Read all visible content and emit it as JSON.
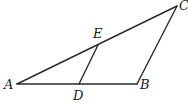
{
  "diagram": {
    "type": "geometry-triangle",
    "points": {
      "A": {
        "label": "A",
        "x": 17,
        "y": 84
      },
      "B": {
        "label": "B",
        "x": 137,
        "y": 84
      },
      "C": {
        "label": "C",
        "x": 177,
        "y": 6
      },
      "D": {
        "label": "D",
        "x": 79,
        "y": 84
      },
      "E": {
        "label": "E",
        "x": 98,
        "y": 45
      }
    },
    "segments": [
      {
        "from": "A",
        "to": "B"
      },
      {
        "from": "B",
        "to": "C"
      },
      {
        "from": "A",
        "to": "C"
      },
      {
        "from": "D",
        "to": "E"
      }
    ]
  }
}
